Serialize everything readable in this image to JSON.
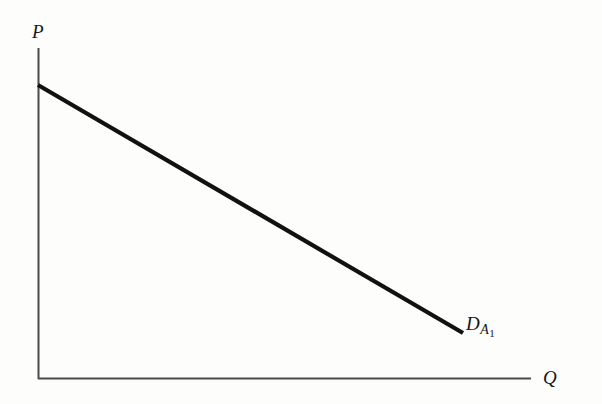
{
  "figure": {
    "background_color": "#fdfdfc",
    "width": 602,
    "height": 404
  },
  "axes": {
    "y_axis": {
      "label": "P",
      "name": "price-axis",
      "color": "#4a4a4a",
      "x": 38,
      "y_top": 48,
      "y_bottom": 379
    },
    "x_axis": {
      "label": "Q",
      "name": "quantity-axis",
      "color": "#4a4a4a",
      "y": 379,
      "x_left": 38,
      "x_right": 531
    }
  },
  "curve": {
    "label_main": "D",
    "label_sub": "A",
    "label_subsub": "1",
    "color": "#111111",
    "stroke_width": 4.2,
    "start": {
      "x": 38,
      "y": 85
    },
    "end": {
      "x": 463,
      "y": 333
    }
  },
  "chart_data": {
    "type": "line",
    "title": "",
    "subtitle": "",
    "xlabel": "Q",
    "ylabel": "P",
    "grid": false,
    "legend": "none",
    "annotations": [
      {
        "text": "D_A1",
        "x": 463,
        "y": 333,
        "placement": "right-of-line-end"
      }
    ],
    "series": [
      {
        "name": "D_A1",
        "label": "D",
        "subscript": "A",
        "sub_subscript": "1",
        "kind": "linear-demand-curve",
        "slope_pixels": -0.583,
        "x": [
          0,
          100
        ],
        "y": [
          100,
          25
        ],
        "points": [
          {
            "x": 0,
            "y": 100
          },
          {
            "x": 25,
            "y": 81.25
          },
          {
            "x": 50,
            "y": 62.5
          },
          {
            "x": 75,
            "y": 43.75
          },
          {
            "x": 100,
            "y": 25
          }
        ]
      }
    ],
    "xlim": [
      0,
      118
    ],
    "ylim": [
      0,
      112
    ],
    "xticks": [],
    "yticks": [],
    "xticklabels": [],
    "yticklabels": []
  }
}
